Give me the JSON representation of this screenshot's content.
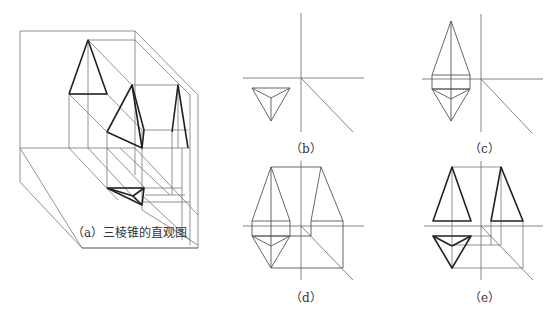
{
  "figures": [
    {
      "id": "a",
      "caption": "（a）三棱锥的直观图"
    },
    {
      "id": "b",
      "caption": "（b）"
    },
    {
      "id": "c",
      "caption": "（c）"
    },
    {
      "id": "d",
      "caption": "（d）"
    },
    {
      "id": "e",
      "caption": "（e）"
    }
  ],
  "colors": {
    "line_thin": "#777777",
    "line_thick": "#222222",
    "background": "#ffffff"
  }
}
